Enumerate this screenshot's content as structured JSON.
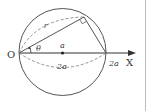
{
  "diagram": {
    "labels": {
      "origin": "O",
      "axis": "X",
      "radius": "r",
      "angle": "θ",
      "center": "a",
      "diameter_arc": "2a",
      "intercept": "2a"
    },
    "colors": {
      "stroke": "#555555",
      "text": "#333333",
      "border": "#bbbbbb"
    }
  }
}
